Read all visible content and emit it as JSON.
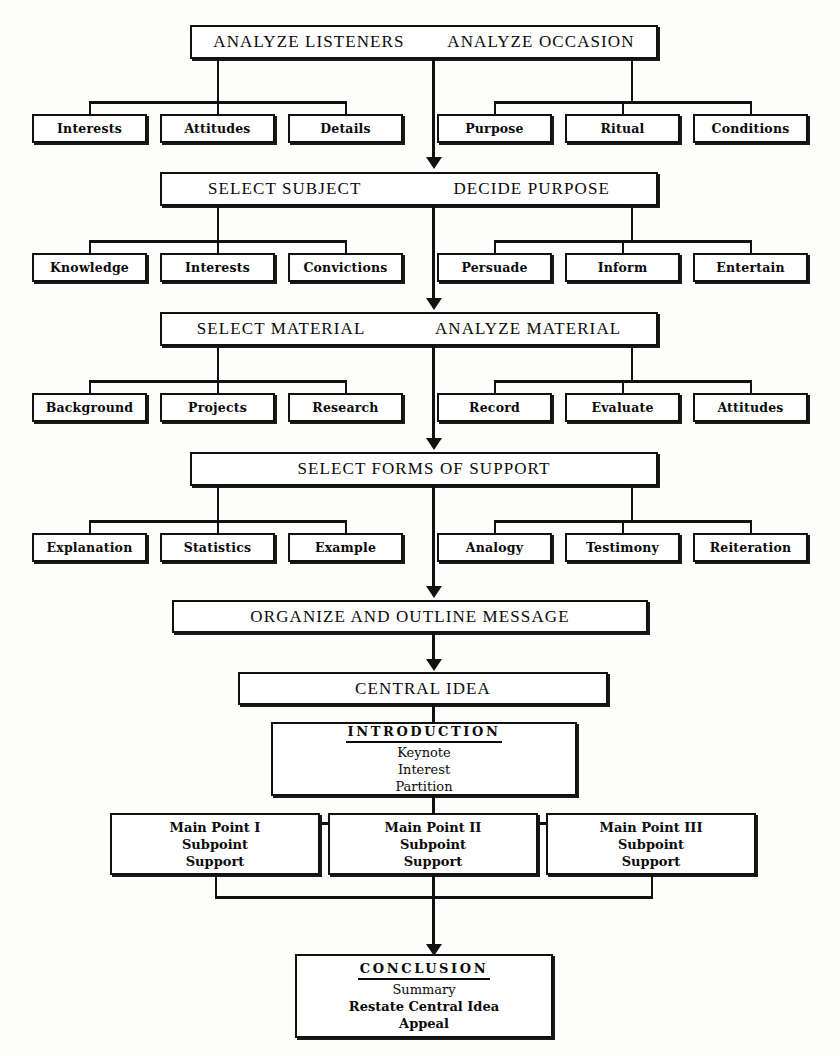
{
  "diagram": {
    "line_color": "#111111",
    "box_fill": "#ffffff"
  },
  "stages": {
    "stage1": {
      "left_label": "ANALYZE LISTENERS",
      "right_label": "ANALYZE OCCASION"
    },
    "stage2": {
      "left_label": "SELECT SUBJECT",
      "right_label": "DECIDE PURPOSE"
    },
    "stage3": {
      "left_label": "SELECT MATERIAL",
      "right_label": "ANALYZE MATERIAL"
    },
    "stage4": {
      "label": "SELECT FORMS OF SUPPORT"
    },
    "stage5": {
      "label": "ORGANIZE AND OUTLINE MESSAGE"
    },
    "stage6": {
      "label": "CENTRAL IDEA"
    }
  },
  "row1": {
    "left": [
      "Interests",
      "Attitudes",
      "Details"
    ],
    "right": [
      "Purpose",
      "Ritual",
      "Conditions"
    ]
  },
  "row2": {
    "left": [
      "Knowledge",
      "Interests",
      "Convictions"
    ],
    "right": [
      "Persuade",
      "Inform",
      "Entertain"
    ]
  },
  "row3": {
    "left": [
      "Background",
      "Projects",
      "Research"
    ],
    "right": [
      "Record",
      "Evaluate",
      "Attitudes"
    ]
  },
  "row4": {
    "left": [
      "Explanation",
      "Statistics",
      "Example"
    ],
    "right": [
      "Analogy",
      "Testimony",
      "Reiteration"
    ]
  },
  "introduction": {
    "heading": "INTRODUCTION",
    "lines": [
      "Keynote",
      "Interest",
      "Partition"
    ]
  },
  "main_points": [
    {
      "heading": "Main Point I",
      "lines": [
        "Subpoint",
        "Support"
      ]
    },
    {
      "heading": "Main Point II",
      "lines": [
        "Subpoint",
        "Support"
      ]
    },
    {
      "heading": "Main Point III",
      "lines": [
        "Subpoint",
        "Support"
      ]
    }
  ],
  "conclusion": {
    "heading": "CONCLUSION",
    "lines": [
      "Summary",
      "Restate Central Idea",
      "Appeal"
    ]
  }
}
